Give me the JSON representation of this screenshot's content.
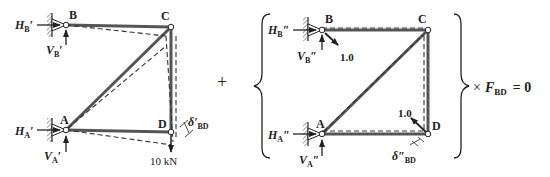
{
  "left": {
    "nodes": {
      "A": "A",
      "B": "B",
      "C": "C",
      "D": "D"
    },
    "H_B": "H",
    "H_B_sub": "B",
    "H_B_prime": "′",
    "V_B": "V",
    "V_B_sub": "B",
    "V_B_prime": "′",
    "H_A": "H",
    "H_A_sub": "A",
    "H_A_prime": "′",
    "V_A": "V",
    "V_A_sub": "A",
    "V_A_prime": "′",
    "delta": "δ′",
    "delta_sub": "BD",
    "load": "10 kN"
  },
  "plus": "+",
  "right": {
    "nodes": {
      "A": "A",
      "B": "B",
      "C": "C",
      "D": "D"
    },
    "H_B": "H",
    "H_B_sub": "B",
    "H_B_prime": "″",
    "V_B": "V",
    "V_B_sub": "B",
    "V_B_prime": "″",
    "H_A": "H",
    "H_A_sub": "A",
    "H_A_prime": "″",
    "V_A": "V",
    "V_A_sub": "A",
    "V_A_prime": "″",
    "unit_force_B": "1.0",
    "unit_force_D": "1.0",
    "delta": "δ″",
    "delta_sub": "BD"
  },
  "equation": {
    "times": "×",
    "F": "F",
    "F_sub": "BD",
    "equals": "= 0"
  },
  "colors": {
    "member": "#555555",
    "ink": "#222222"
  }
}
